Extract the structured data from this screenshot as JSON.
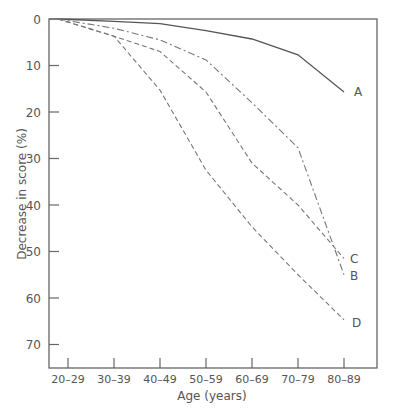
{
  "chart_data": {
    "type": "line",
    "title": "",
    "xlabel": "Age (years)",
    "ylabel": "Decrease in score (%)",
    "categories": [
      "20–29",
      "30–39",
      "40–49",
      "50–59",
      "60–69",
      "70–79",
      "80–89"
    ],
    "yticks": [
      0,
      10,
      20,
      30,
      40,
      50,
      60,
      70
    ],
    "ylim": [
      0,
      75
    ],
    "y_inverted": true,
    "grid": false,
    "legend": "direct labels at line ends",
    "series": [
      {
        "name": "A",
        "style": "solid",
        "values": [
          0,
          0.5,
          1,
          2.5,
          4.3,
          7.7,
          15.7
        ]
      },
      {
        "name": "B",
        "style": "dash-dot",
        "values": [
          0,
          2,
          4.5,
          8.8,
          18,
          27.7,
          55
        ]
      },
      {
        "name": "C",
        "style": "dashed",
        "values": [
          0,
          3.7,
          7,
          15.7,
          31,
          40,
          51.5
        ]
      },
      {
        "name": "D",
        "style": "dashed",
        "values": [
          0,
          3.7,
          15.3,
          32.5,
          44.7,
          55,
          64.7
        ]
      }
    ]
  },
  "labels": {
    "xlabel": "Age (years)",
    "ylabel": "Decrease in score (%)"
  }
}
